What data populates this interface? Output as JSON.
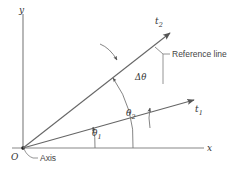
{
  "diagram": {
    "axes": {
      "x_label": "x",
      "y_label": "y",
      "origin_label": "O",
      "axis_callout": "Axis"
    },
    "vectors": [
      {
        "id": "t1",
        "label_base": "t",
        "label_sub": "1"
      },
      {
        "id": "t2",
        "label_base": "t",
        "label_sub": "2"
      }
    ],
    "angles": {
      "theta1": {
        "base": "θ",
        "sub": "1"
      },
      "theta2": {
        "base": "θ",
        "sub": "2"
      },
      "delta_theta": "Δθ"
    },
    "reference_line_label": "Reference line",
    "colors": {
      "line": "#666666",
      "axis": "#888888",
      "text": "#333333",
      "background": "#ffffff"
    }
  }
}
